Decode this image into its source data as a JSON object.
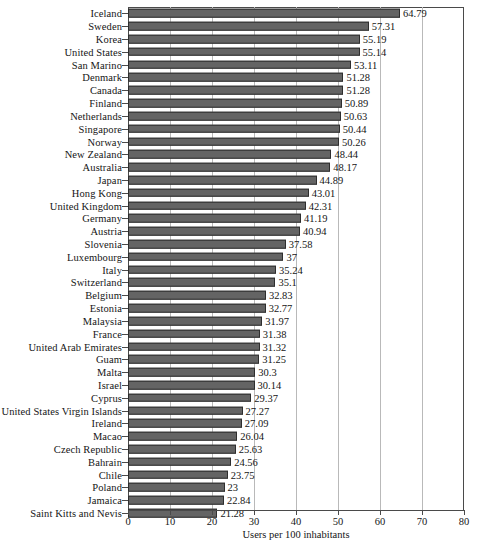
{
  "chart_data": {
    "type": "bar",
    "orientation": "horizontal",
    "title": "",
    "xlabel": "Users per 100 inhabitants",
    "ylabel": "",
    "xlim": [
      0,
      80
    ],
    "xticks": [
      0,
      10,
      20,
      30,
      40,
      50,
      60,
      70,
      80
    ],
    "grid": true,
    "legend": null,
    "bar_color": "#646464",
    "bar_edge_color": "#2e2e2e",
    "categories": [
      "Iceland",
      "Sweden",
      "Korea",
      "United States",
      "San Marino",
      "Denmark",
      "Canada",
      "Finland",
      "Netherlands",
      "Singapore",
      "Norway",
      "New Zealand",
      "Australia",
      "Japan",
      "Hong Kong",
      "United Kingdom",
      "Germany",
      "Austria",
      "Slovenia",
      "Luxembourg",
      "Italy",
      "Switzerland",
      "Belgium",
      "Estonia",
      "Malaysia",
      "France",
      "United Arab Emirates",
      "Guam",
      "Malta",
      "Israel",
      "Cyprus",
      "United States Virgin Islands",
      "Ireland",
      "Macao",
      "Czech Republic",
      "Bahrain",
      "Chile",
      "Poland",
      "Jamaica",
      "Saint Kitts and Nevis"
    ],
    "values": [
      64.79,
      57.31,
      55.19,
      55.14,
      53.11,
      51.28,
      51.28,
      50.89,
      50.63,
      50.44,
      50.26,
      48.44,
      48.17,
      44.89,
      43.01,
      42.31,
      41.19,
      40.94,
      37.58,
      37,
      35.24,
      35.1,
      32.83,
      32.77,
      31.97,
      31.38,
      31.32,
      31.25,
      30.3,
      30.14,
      29.37,
      27.27,
      27.09,
      26.04,
      25.63,
      24.56,
      23.75,
      23,
      22.84,
      21.28
    ],
    "value_labels": [
      "64.79",
      "57.31",
      "55.19",
      "55.14",
      "53.11",
      "51.28",
      "51.28",
      "50.89",
      "50.63",
      "50.44",
      "50.26",
      "48.44",
      "48.17",
      "44.89",
      "43.01",
      "42.31",
      "41.19",
      "40.94",
      "37.58",
      "37",
      "35.24",
      "35.1",
      "32.83",
      "32.77",
      "31.97",
      "31.38",
      "31.32",
      "31.25",
      "30.3",
      "30.14",
      "29.37",
      "27.27",
      "27.09",
      "26.04",
      "25.63",
      "24.56",
      "23.75",
      "23",
      "22.84",
      "21.28"
    ]
  },
  "caption": ""
}
